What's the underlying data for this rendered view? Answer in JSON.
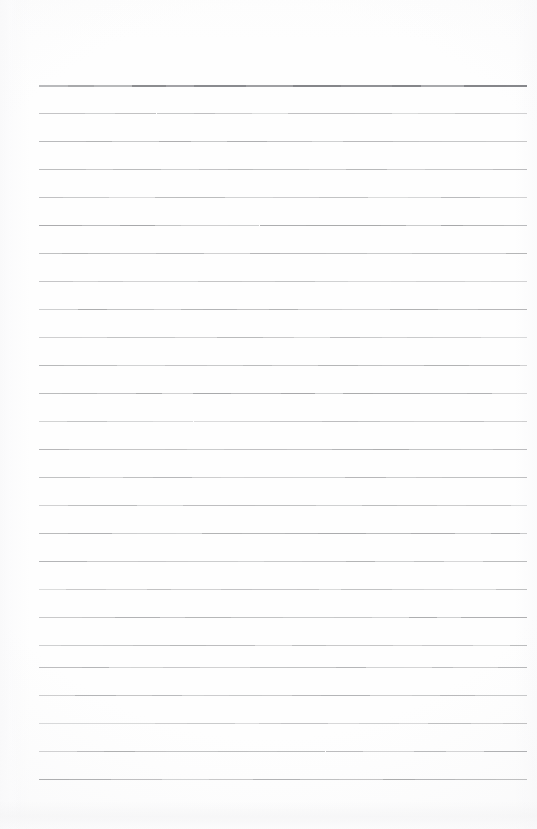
{
  "document": {
    "kind": "scanned-blank-ruled-notepad-page",
    "page_width": 537,
    "page_height": 829,
    "background_color": "#fefefe",
    "text_content": "",
    "visible_text": [],
    "has_handwriting": false,
    "has_printed_text": false
  },
  "ruling": {
    "line_color": "#a0a1a3",
    "header_line_color": "#85868a",
    "first_line_y": 85,
    "line_spacing": 28,
    "line_count": 26,
    "left_x": 39,
    "right_x": 527,
    "line_thickness": 1,
    "header_line_thickness": 2,
    "header_line_index": 0,
    "lines_y": [
      85,
      113,
      141,
      169,
      197,
      225,
      253,
      281,
      309,
      337,
      365,
      393,
      421,
      449,
      477,
      505,
      533,
      561,
      589,
      617,
      645,
      667,
      695,
      723,
      751,
      779
    ],
    "line_opacities": [
      1.0,
      0.62,
      0.78,
      0.7,
      0.66,
      0.88,
      0.72,
      0.6,
      0.82,
      0.68,
      0.74,
      0.86,
      0.64,
      0.78,
      0.7,
      0.66,
      0.84,
      0.72,
      0.62,
      0.8,
      0.68,
      0.76,
      0.88,
      0.64,
      0.78,
      0.82
    ]
  },
  "margins": {
    "top_margin_px": 85,
    "bottom_margin_px": 50,
    "left_margin_px": 39,
    "right_margin_px": 10
  },
  "scan_artifacts": {
    "bottom_band_label": "bottom-edge-scan-shadow",
    "left_band_label": "left-edge-scan-shadow",
    "speckle_tint": "#f4f4f5"
  }
}
